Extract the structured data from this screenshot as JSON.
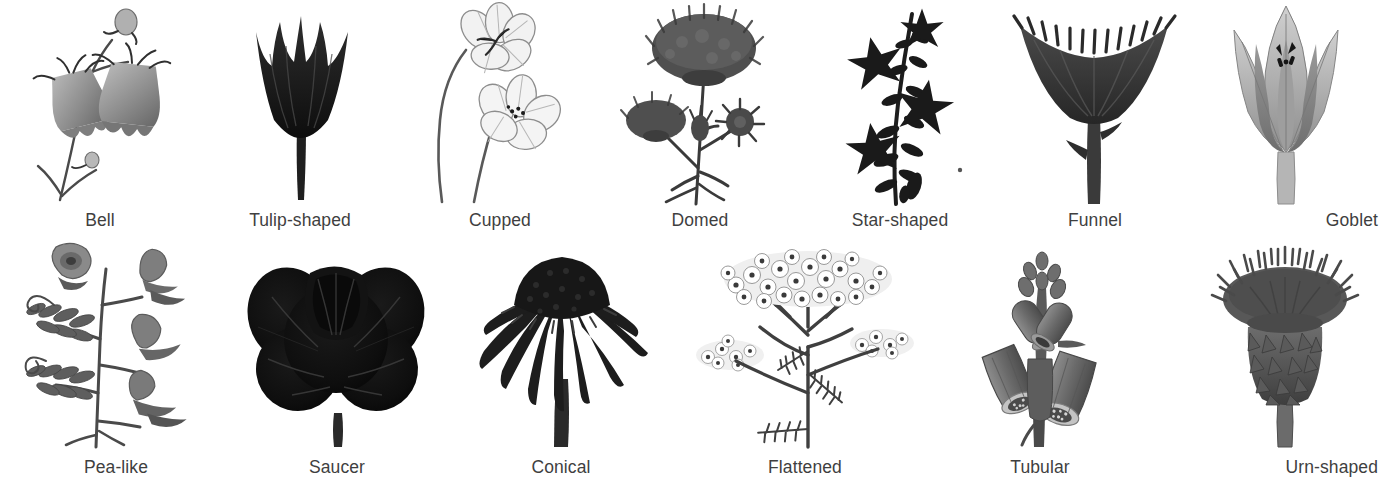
{
  "page": {
    "background_color": "#ffffff",
    "caption_color": "#3f3f3f",
    "ink_color": "#2b2b2b",
    "columns_row_1": 7,
    "columns_row_2": 6
  },
  "rows": [
    {
      "index": 1,
      "items": [
        {
          "label": "Bell",
          "icon": "bell-flower-illustration",
          "tone": "mid-gray"
        },
        {
          "label": "Tulip-shaped",
          "icon": "tulip-flower-illustration",
          "tone": "near-black"
        },
        {
          "label": "Cupped",
          "icon": "cupped-flower-illustration",
          "tone": "light-gray"
        },
        {
          "label": "Domed",
          "icon": "domed-flower-illustration",
          "tone": "dark-gray"
        },
        {
          "label": "Star-shaped",
          "icon": "star-flower-illustration",
          "tone": "near-black"
        },
        {
          "label": "Funnel",
          "icon": "funnel-flower-illustration",
          "tone": "dark-gray"
        },
        {
          "label": "Goblet",
          "icon": "goblet-flower-illustration",
          "tone": "mid-gray"
        }
      ]
    },
    {
      "index": 2,
      "items": [
        {
          "label": "Pea-like",
          "icon": "pea-flower-illustration",
          "tone": "mid-gray"
        },
        {
          "label": "Saucer",
          "icon": "saucer-flower-illustration",
          "tone": "near-black"
        },
        {
          "label": "Conical",
          "icon": "conical-flower-illustration",
          "tone": "near-black"
        },
        {
          "label": "Flattened",
          "icon": "flattened-flower-illustration",
          "tone": "light-gray"
        },
        {
          "label": "Tubular",
          "icon": "tubular-flower-illustration",
          "tone": "dark-gray"
        },
        {
          "label": "Urn-shaped",
          "icon": "urn-flower-illustration",
          "tone": "dark-gray"
        }
      ]
    }
  ]
}
